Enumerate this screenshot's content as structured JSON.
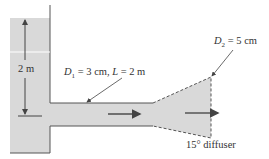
{
  "diagram": {
    "type": "reservoir-pipe-diffuser",
    "tank": {
      "height_label": "2 m"
    },
    "pipe": {
      "diameter_symbol": "D",
      "diameter_subscript": "1",
      "diameter_value": " = 3 cm, ",
      "length_symbol": "L",
      "length_value": " = 2 m"
    },
    "diffuser": {
      "diameter_symbol": "D",
      "diameter_subscript": "2",
      "diameter_value": " = 5 cm",
      "caption": "15° diffuser"
    },
    "colors": {
      "fluid": "#d9d9d9",
      "outline": "#555555",
      "arrow": "#555555",
      "background": "#ffffff"
    }
  }
}
